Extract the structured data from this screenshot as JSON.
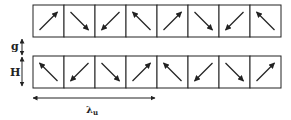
{
  "diagram": {
    "type": "halbach-array",
    "rows": [
      {
        "name": "top-row",
        "arrows": [
          "ne",
          "se",
          "sw",
          "nw",
          "ne",
          "se",
          "sw",
          "nw"
        ]
      },
      {
        "name": "bottom-row",
        "arrows": [
          "nw",
          "sw",
          "se",
          "ne",
          "nw",
          "sw",
          "se",
          "ne"
        ]
      }
    ],
    "labels": {
      "gap": "g",
      "height": "H",
      "wavelength": "λ",
      "wavelength_sub": "u"
    },
    "colors": {
      "stroke": "#222222",
      "background": "#ffffff"
    }
  }
}
